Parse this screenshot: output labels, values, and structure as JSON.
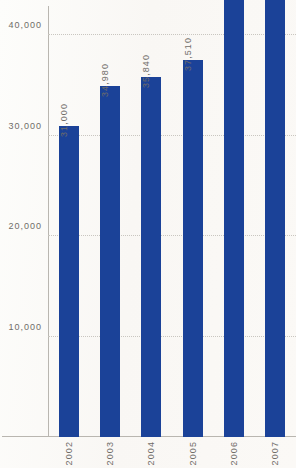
{
  "chart_data": {
    "type": "bar",
    "title": "",
    "xlabel": "",
    "ylabel": "",
    "categories": [
      "2002",
      "2003",
      "2004",
      "2005",
      "2006",
      "2007"
    ],
    "values": [
      31000,
      34980,
      35840,
      37510,
      null,
      null
    ],
    "value_labels": [
      "31,000",
      "34,980",
      "35,840",
      "37,510",
      "",
      ""
    ],
    "ylim": [
      0,
      43500
    ],
    "yticks": [
      10000,
      20000,
      30000,
      40000
    ],
    "ytick_labels": [
      "10,000",
      "20,000",
      "30,000",
      "40,000"
    ],
    "grid": true,
    "grid_style": "dotted",
    "legend": "none",
    "bar_color": "#1b4298",
    "axis_color": "#b9b6b0",
    "grid_color": "#c9c6c0",
    "label_color": "#6f6c68",
    "background_color": "#fbfaf8",
    "bar_tops_px": [
      120,
      91,
      71,
      55,
      0,
      0
    ],
    "baseline_px": 437
  }
}
